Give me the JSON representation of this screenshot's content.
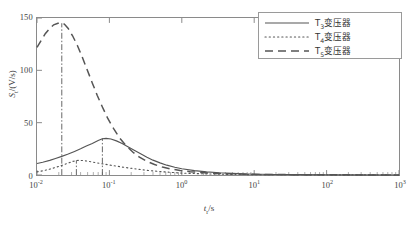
{
  "chart_data": {
    "type": "line",
    "title": "",
    "xlabel": "t_r/s",
    "ylabel": "S_t/(V/s)",
    "xscale": "log",
    "xlim": [
      0.01,
      1000
    ],
    "ylim": [
      0,
      150
    ],
    "grid": false,
    "legend_position": "top-right",
    "x_ticks": [
      {
        "value": 0.01,
        "mantissa": "10",
        "exponent": "-2"
      },
      {
        "value": 0.1,
        "mantissa": "10",
        "exponent": "-1"
      },
      {
        "value": 1,
        "mantissa": "10",
        "exponent": "0"
      },
      {
        "value": 10,
        "mantissa": "10",
        "exponent": "1"
      },
      {
        "value": 100,
        "mantissa": "10",
        "exponent": "2"
      },
      {
        "value": 1000,
        "mantissa": "10",
        "exponent": "3"
      }
    ],
    "y_ticks": [
      {
        "value": 0,
        "label": "0"
      },
      {
        "value": 50,
        "label": "50"
      },
      {
        "value": 100,
        "label": "100"
      },
      {
        "value": 150,
        "label": "150"
      }
    ],
    "series": [
      {
        "name": "T3变压器",
        "style": "solid",
        "peak": {
          "x": 0.08,
          "y": 35
        },
        "points": [
          [
            0.01,
            11.0
          ],
          [
            0.012,
            12.2
          ],
          [
            0.015,
            14.0
          ],
          [
            0.018,
            15.8
          ],
          [
            0.022,
            17.8
          ],
          [
            0.027,
            20.0
          ],
          [
            0.033,
            22.5
          ],
          [
            0.04,
            25.0
          ],
          [
            0.048,
            27.6
          ],
          [
            0.058,
            30.2
          ],
          [
            0.07,
            33.0
          ],
          [
            0.08,
            34.6
          ],
          [
            0.09,
            35.0
          ],
          [
            0.105,
            34.4
          ],
          [
            0.125,
            32.6
          ],
          [
            0.15,
            30.0
          ],
          [
            0.18,
            27.0
          ],
          [
            0.22,
            23.6
          ],
          [
            0.27,
            20.2
          ],
          [
            0.33,
            17.0
          ],
          [
            0.4,
            14.2
          ],
          [
            0.5,
            11.6
          ],
          [
            0.62,
            9.4
          ],
          [
            0.8,
            7.4
          ],
          [
            1.0,
            6.0
          ],
          [
            1.5,
            4.2
          ],
          [
            2.2,
            3.0
          ],
          [
            3.3,
            2.1
          ],
          [
            5.0,
            1.5
          ],
          [
            8.0,
            1.0
          ],
          [
            12.0,
            0.7
          ],
          [
            20.0,
            0.5
          ],
          [
            40.0,
            0.3
          ],
          [
            100.0,
            0.2
          ],
          [
            300.0,
            0.1
          ],
          [
            1000.0,
            0.05
          ]
        ]
      },
      {
        "name": "T4变压器",
        "style": "dotted",
        "peak": {
          "x": 0.035,
          "y": 14
        },
        "points": [
          [
            0.01,
            3.0
          ],
          [
            0.012,
            4.0
          ],
          [
            0.015,
            5.6
          ],
          [
            0.018,
            7.2
          ],
          [
            0.022,
            9.2
          ],
          [
            0.027,
            11.4
          ],
          [
            0.032,
            13.2
          ],
          [
            0.037,
            14.0
          ],
          [
            0.043,
            13.8
          ],
          [
            0.05,
            13.2
          ],
          [
            0.06,
            12.2
          ],
          [
            0.072,
            11.2
          ],
          [
            0.088,
            10.2
          ],
          [
            0.105,
            9.3
          ],
          [
            0.13,
            8.3
          ],
          [
            0.16,
            7.3
          ],
          [
            0.2,
            6.4
          ],
          [
            0.25,
            5.5
          ],
          [
            0.32,
            4.6
          ],
          [
            0.4,
            3.9
          ],
          [
            0.52,
            3.2
          ],
          [
            0.68,
            2.6
          ],
          [
            0.9,
            2.0
          ],
          [
            1.2,
            1.6
          ],
          [
            1.8,
            1.2
          ],
          [
            2.8,
            0.9
          ],
          [
            4.5,
            0.6
          ],
          [
            8.0,
            0.4
          ],
          [
            15.0,
            0.3
          ],
          [
            40.0,
            0.2
          ],
          [
            150.0,
            0.1
          ],
          [
            1000.0,
            0.05
          ]
        ]
      },
      {
        "name": "T5变压器",
        "style": "dashed",
        "peak": {
          "x": 0.022,
          "y": 145
        },
        "points": [
          [
            0.01,
            122.0
          ],
          [
            0.0115,
            129.0
          ],
          [
            0.013,
            135.0
          ],
          [
            0.015,
            140.0
          ],
          [
            0.017,
            143.5
          ],
          [
            0.0195,
            145.0
          ],
          [
            0.022,
            145.5
          ],
          [
            0.024,
            144.0
          ],
          [
            0.027,
            140.0
          ],
          [
            0.031,
            133.0
          ],
          [
            0.036,
            124.0
          ],
          [
            0.042,
            113.0
          ],
          [
            0.049,
            101.0
          ],
          [
            0.058,
            88.0
          ],
          [
            0.068,
            76.0
          ],
          [
            0.08,
            65.0
          ],
          [
            0.095,
            54.0
          ],
          [
            0.115,
            44.0
          ],
          [
            0.14,
            35.0
          ],
          [
            0.17,
            28.0
          ],
          [
            0.21,
            22.0
          ],
          [
            0.26,
            17.0
          ],
          [
            0.33,
            13.0
          ],
          [
            0.42,
            10.0
          ],
          [
            0.54,
            7.6
          ],
          [
            0.7,
            5.8
          ],
          [
            0.95,
            4.3
          ],
          [
            1.3,
            3.2
          ],
          [
            1.9,
            2.3
          ],
          [
            3.0,
            1.6
          ],
          [
            5.0,
            1.1
          ],
          [
            9.0,
            0.7
          ],
          [
            18.0,
            0.45
          ],
          [
            45.0,
            0.27
          ],
          [
            150.0,
            0.15
          ],
          [
            1000.0,
            0.06
          ]
        ]
      }
    ],
    "peak_markers": [
      {
        "series": "T5变压器",
        "x": 0.022,
        "y": 145
      },
      {
        "series": "T4变压器",
        "x": 0.035,
        "y": 14
      },
      {
        "series": "T3变压器",
        "x": 0.08,
        "y": 35
      }
    ],
    "legend": [
      {
        "label": "T3变压器",
        "style": "solid"
      },
      {
        "label": "T4变压器",
        "style": "dotted"
      },
      {
        "label": "T5变压器",
        "style": "dashed"
      }
    ],
    "colors": {
      "line": "#555555",
      "axis": "#8a8a8a",
      "text": "#3a3a3a"
    }
  },
  "axis": {
    "ylabel_sym": "S",
    "ylabel_sub": "t",
    "ylabel_unit": "/(V/s)",
    "xlabel_sym": "t",
    "xlabel_sub": "r",
    "xlabel_unit": "/s"
  }
}
